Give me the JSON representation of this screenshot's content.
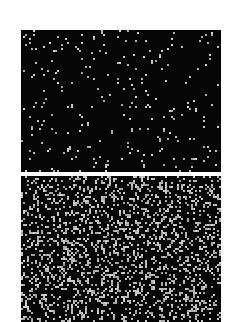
{
  "figure": {
    "background": "#ffffff",
    "panels": [
      {
        "id": "sparse",
        "background": "#050505",
        "dot_color": "#d8d8d8",
        "dot_size": 2,
        "dot_count": 260,
        "seed": 17
      },
      {
        "id": "dense",
        "background": "#050505",
        "dot_color": "#d0d0d0",
        "dot_size": 2,
        "dot_count": 2000,
        "seed": 91
      }
    ]
  }
}
